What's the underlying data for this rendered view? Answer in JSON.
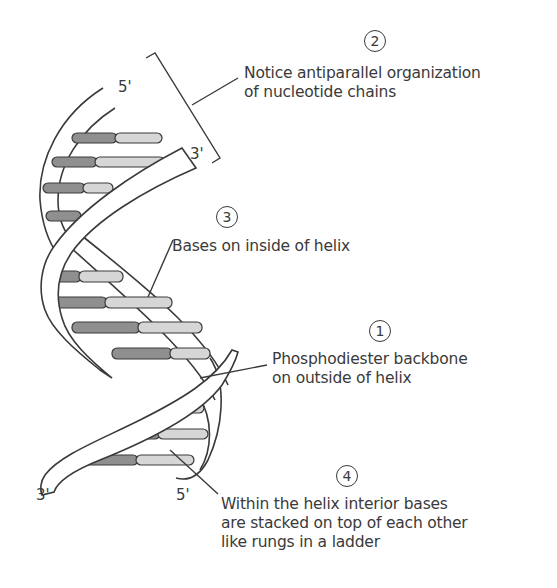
{
  "diagram": {
    "colors": {
      "background": "#ffffff",
      "stroke": "#3a3a3a",
      "base_dark": "#8f8f8f",
      "base_light": "#d6d6d6",
      "text": "#3a3a3a"
    },
    "strand_ends": {
      "top_left": "5'",
      "top_right": "3'",
      "bottom_left": "3'",
      "bottom_right": "5'"
    },
    "annotations": [
      {
        "number": "1",
        "line1": "Phosphodiester backbone",
        "line2": "on outside of helix",
        "line3": ""
      },
      {
        "number": "2",
        "line1": "Notice antiparallel organization",
        "line2": "of nucleotide chains",
        "line3": ""
      },
      {
        "number": "3",
        "line1": "Bases on inside of helix",
        "line2": "",
        "line3": ""
      },
      {
        "number": "4",
        "line1": "Within the helix interior bases",
        "line2": "are stacked on top of each other",
        "line3": "like rungs in a ladder"
      }
    ]
  }
}
